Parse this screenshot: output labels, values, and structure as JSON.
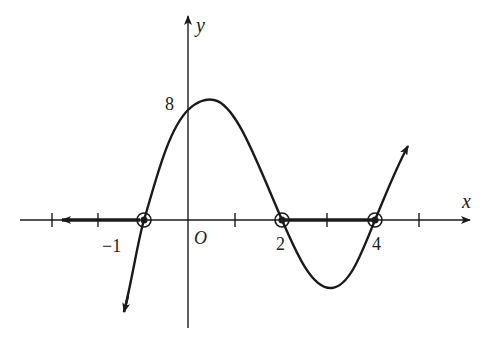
{
  "figure": {
    "type": "function-graph",
    "function": "f(x) = (x+1)(x-2)(x-4)",
    "axes": {
      "x_label": "x",
      "y_label": "y",
      "origin_label": "O"
    },
    "tick_labels": {
      "x_neg1": "−1",
      "x_2": "2",
      "x_4": "4",
      "y_8": "8"
    },
    "x_ticks": [
      -3,
      -2,
      -1,
      1,
      2,
      3,
      4,
      5
    ],
    "roots": [
      -1,
      2,
      4
    ],
    "y_intercept": 8,
    "highlighted_intervals": [
      {
        "from": "-inf",
        "to": -1,
        "style": "bold ray with arrow"
      },
      {
        "from": 2,
        "to": 4,
        "style": "bold segment"
      }
    ],
    "colors": {
      "stroke": "#1a1a1a",
      "background": "#ffffff"
    }
  }
}
